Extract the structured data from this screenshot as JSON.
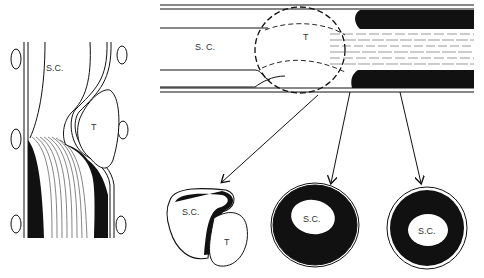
{
  "figure": {
    "colors": {
      "ink": "#111111",
      "background": "#ffffff",
      "label": "#333333"
    }
  },
  "left_panel": {
    "labels": {
      "spinal_cord": "S.C.",
      "tumor": "T"
    }
  },
  "top_panel": {
    "labels": {
      "spinal_cord": "S. C.",
      "tumor": "T"
    }
  },
  "cross_sections": [
    {
      "labels": [
        "S.C.",
        "T"
      ],
      "note": "cord compressed by tumor"
    },
    {
      "labels": [
        "S.C."
      ],
      "note": "eccentric cord with thick dark rim"
    },
    {
      "labels": [
        "S.C."
      ],
      "note": "centered cord with thick dark rim"
    }
  ],
  "arrows": [
    {
      "from": [
        318,
        95
      ],
      "to": [
        222,
        182
      ]
    },
    {
      "from": [
        350,
        92
      ],
      "to": [
        331,
        183
      ]
    },
    {
      "from": [
        400,
        92
      ],
      "to": [
        421,
        183
      ]
    }
  ]
}
